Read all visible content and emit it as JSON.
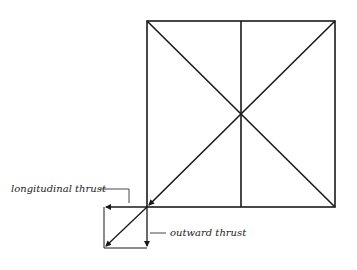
{
  "diagram": {
    "labels": {
      "longitudinal": "longitudinal thrust",
      "outward": "outward thrust"
    },
    "colors": {
      "stroke": "#1a1a1a",
      "background": "#ffffff"
    }
  }
}
